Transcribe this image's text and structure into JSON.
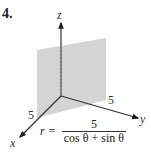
{
  "problem_number": "4.",
  "axes": {
    "x_label": "x",
    "y_label": "y",
    "z_label": "z"
  },
  "ticks": {
    "x_tick": "5",
    "y_tick": "5"
  },
  "equation": {
    "lhs": "r =",
    "numerator": "5",
    "denominator": "cos θ + sin θ"
  },
  "colors": {
    "plane": "#d4d4d4",
    "axis": "#333333"
  }
}
